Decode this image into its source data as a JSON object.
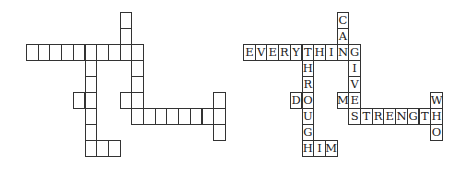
{
  "layout": {
    "cell_w": 11.7,
    "cell_h": 16.0,
    "puzzle_origin": [
      26,
      12
    ],
    "solution_origin": [
      243,
      12
    ]
  },
  "colors": {
    "border": "#333333",
    "text": "#222222",
    "background": "#ffffff"
  },
  "words": [
    {
      "word": "CAN",
      "dir": "down",
      "col": 8,
      "row": 0
    },
    {
      "word": "EVERYTHING",
      "dir": "across",
      "col": 0,
      "row": 2
    },
    {
      "word": "GIVE",
      "dir": "down",
      "col": 9,
      "row": 2
    },
    {
      "word": "THROUGH",
      "dir": "down",
      "col": 5,
      "row": 2
    },
    {
      "word": "DO",
      "dir": "across",
      "col": 4,
      "row": 5
    },
    {
      "word": "ME",
      "dir": "across",
      "col": 8,
      "row": 5
    },
    {
      "word": "STRENGTH",
      "dir": "across",
      "col": 9,
      "row": 6
    },
    {
      "word": "WHO",
      "dir": "down",
      "col": 16,
      "row": 5
    },
    {
      "word": "HIM",
      "dir": "across",
      "col": 5,
      "row": 8
    }
  ],
  "puzzle": {
    "label": "empty-crossword-grid"
  },
  "solution": {
    "label": "solved-crossword-grid"
  }
}
